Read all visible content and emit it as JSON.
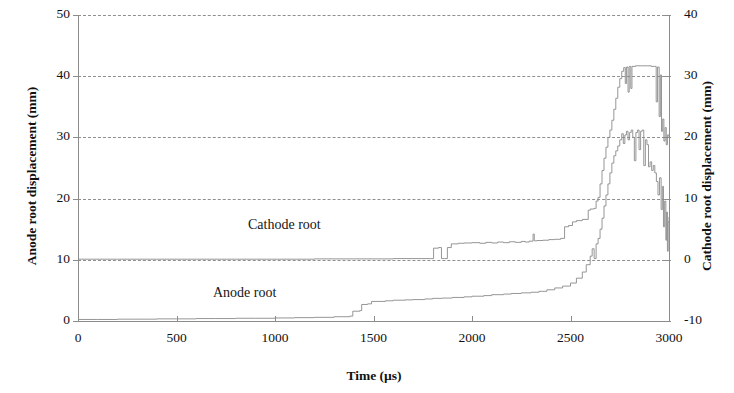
{
  "chart_data": {
    "type": "line",
    "title": "",
    "xlabel": "Time (µs)",
    "ylabel": "Anode root displacement (mm)",
    "y2label": "Cathode root displacement (mm)",
    "xlim": [
      0,
      3000
    ],
    "ylim": [
      0,
      50
    ],
    "y2lim": [
      -10,
      40
    ],
    "xticks": [
      0,
      500,
      1000,
      1500,
      2000,
      2500,
      3000
    ],
    "yticks": [
      0,
      10,
      20,
      30,
      40,
      50
    ],
    "y2ticks": [
      -10,
      0,
      10,
      20,
      30,
      40
    ],
    "xtick_labels": [
      "0",
      "500",
      "1000",
      "1500",
      "2000",
      "2500",
      "3000"
    ],
    "ytick_labels": [
      "0",
      "10",
      "20",
      "30",
      "40",
      "50"
    ],
    "y2tick_labels": [
      "-10",
      "0",
      "10",
      "20",
      "30",
      "40"
    ],
    "grid": true,
    "grid_style": "dashed-horizontal",
    "legend": "none",
    "line_color": "#8a8a8a",
    "axis_color": "#8c8c8c",
    "text_color": "#111111",
    "annotations": [
      {
        "text": "Cathode root",
        "x": 1050,
        "y_left": 16.5
      },
      {
        "text": "Anode root",
        "x": 870,
        "y_left": 5.5
      }
    ],
    "series": [
      {
        "name": "Anode root",
        "axis": "left",
        "units": "mm",
        "points": [
          [
            0,
            0.25
          ],
          [
            100,
            0.25
          ],
          [
            200,
            0.3
          ],
          [
            300,
            0.3
          ],
          [
            400,
            0.35
          ],
          [
            500,
            0.35
          ],
          [
            600,
            0.4
          ],
          [
            700,
            0.4
          ],
          [
            800,
            0.45
          ],
          [
            900,
            0.45
          ],
          [
            1000,
            0.5
          ],
          [
            1100,
            0.55
          ],
          [
            1200,
            0.6
          ],
          [
            1300,
            0.7
          ],
          [
            1380,
            0.8
          ],
          [
            1395,
            1.6
          ],
          [
            1430,
            1.7
          ],
          [
            1440,
            2.7
          ],
          [
            1470,
            2.8
          ],
          [
            1490,
            3.2
          ],
          [
            1560,
            3.3
          ],
          [
            1600,
            3.4
          ],
          [
            1660,
            3.45
          ],
          [
            1700,
            3.5
          ],
          [
            1760,
            3.6
          ],
          [
            1800,
            3.7
          ],
          [
            1850,
            3.75
          ],
          [
            1900,
            3.85
          ],
          [
            1960,
            3.95
          ],
          [
            2000,
            4.05
          ],
          [
            2060,
            4.15
          ],
          [
            2100,
            4.3
          ],
          [
            2160,
            4.4
          ],
          [
            2200,
            4.5
          ],
          [
            2250,
            4.6
          ],
          [
            2300,
            4.7
          ],
          [
            2340,
            4.85
          ],
          [
            2380,
            5.1
          ],
          [
            2420,
            5.4
          ],
          [
            2460,
            5.7
          ],
          [
            2500,
            6.2
          ],
          [
            2530,
            7.0
          ],
          [
            2560,
            8.0
          ],
          [
            2580,
            9.2
          ],
          [
            2600,
            10.6
          ],
          [
            2610,
            11.8
          ],
          [
            2620,
            10.2
          ],
          [
            2630,
            12.6
          ],
          [
            2640,
            13.5
          ],
          [
            2650,
            15.0
          ],
          [
            2660,
            16.8
          ],
          [
            2670,
            18.8
          ],
          [
            2680,
            20.6
          ],
          [
            2690,
            22.4
          ],
          [
            2700,
            24.2
          ],
          [
            2710,
            25.8
          ],
          [
            2720,
            27.0
          ],
          [
            2730,
            27.8
          ],
          [
            2740,
            28.6
          ],
          [
            2750,
            29.6
          ],
          [
            2760,
            30.6
          ],
          [
            2768,
            29.0
          ],
          [
            2776,
            30.4
          ],
          [
            2784,
            31.0
          ],
          [
            2792,
            29.6
          ],
          [
            2800,
            30.8
          ],
          [
            2808,
            31.2
          ],
          [
            2816,
            30.0
          ],
          [
            2824,
            26.2
          ],
          [
            2832,
            30.8
          ],
          [
            2840,
            31.2
          ],
          [
            2848,
            28.0
          ],
          [
            2856,
            31.0
          ],
          [
            2864,
            31.2
          ],
          [
            2872,
            25.4
          ],
          [
            2880,
            29.6
          ],
          [
            2888,
            28.8
          ],
          [
            2896,
            25.2
          ],
          [
            2904,
            26.0
          ],
          [
            2912,
            24.6
          ],
          [
            2920,
            25.4
          ],
          [
            2928,
            24.2
          ],
          [
            2936,
            22.8
          ],
          [
            2944,
            20.6
          ],
          [
            2952,
            23.4
          ],
          [
            2960,
            18.2
          ],
          [
            2966,
            22.0
          ],
          [
            2972,
            15.4
          ],
          [
            2978,
            19.6
          ],
          [
            2984,
            13.2
          ],
          [
            2988,
            17.8
          ],
          [
            2992,
            11.4
          ],
          [
            2996,
            16.2
          ],
          [
            3000,
            17.0
          ]
        ]
      },
      {
        "name": "Cathode root",
        "axis": "right",
        "units": "mm",
        "points_left_axis": [
          [
            0,
            10.1
          ],
          [
            200,
            10.1
          ],
          [
            400,
            10.1
          ],
          [
            600,
            10.1
          ],
          [
            800,
            10.1
          ],
          [
            1000,
            10.1
          ],
          [
            1200,
            10.15
          ],
          [
            1400,
            10.15
          ],
          [
            1600,
            10.2
          ],
          [
            1700,
            10.2
          ],
          [
            1790,
            10.2
          ],
          [
            1805,
            11.9
          ],
          [
            1830,
            12.0
          ],
          [
            1845,
            10.2
          ],
          [
            1860,
            10.2
          ],
          [
            1875,
            12.0
          ],
          [
            1895,
            12.6
          ],
          [
            1930,
            12.7
          ],
          [
            1960,
            12.75
          ],
          [
            2000,
            12.8
          ],
          [
            2040,
            12.7
          ],
          [
            2070,
            12.85
          ],
          [
            2100,
            12.75
          ],
          [
            2130,
            12.9
          ],
          [
            2160,
            12.8
          ],
          [
            2190,
            12.95
          ],
          [
            2220,
            12.85
          ],
          [
            2250,
            13.0
          ],
          [
            2270,
            12.9
          ],
          [
            2290,
            13.05
          ],
          [
            2310,
            14.2
          ],
          [
            2316,
            13.1
          ],
          [
            2330,
            13.15
          ],
          [
            2360,
            13.2
          ],
          [
            2390,
            13.3
          ],
          [
            2420,
            13.35
          ],
          [
            2450,
            13.5
          ],
          [
            2470,
            15.4
          ],
          [
            2490,
            15.6
          ],
          [
            2510,
            16.2
          ],
          [
            2530,
            16.4
          ],
          [
            2560,
            16.6
          ],
          [
            2590,
            18.1
          ],
          [
            2600,
            18.3
          ],
          [
            2620,
            18.4
          ],
          [
            2630,
            19.6
          ],
          [
            2640,
            20.2
          ],
          [
            2650,
            22.4
          ],
          [
            2660,
            24.6
          ],
          [
            2670,
            26.6
          ],
          [
            2680,
            28.4
          ],
          [
            2690,
            30.0
          ],
          [
            2700,
            31.2
          ],
          [
            2710,
            32.8
          ],
          [
            2720,
            34.6
          ],
          [
            2730,
            36.4
          ],
          [
            2740,
            38.2
          ],
          [
            2750,
            39.6
          ],
          [
            2760,
            40.8
          ],
          [
            2770,
            41.4
          ],
          [
            2778,
            38.8
          ],
          [
            2784,
            41.5
          ],
          [
            2792,
            37.4
          ],
          [
            2798,
            41.6
          ],
          [
            2806,
            38.0
          ],
          [
            2812,
            41.6
          ],
          [
            2830,
            41.7
          ],
          [
            2860,
            41.7
          ],
          [
            2890,
            41.7
          ],
          [
            2910,
            41.6
          ],
          [
            2925,
            41.6
          ],
          [
            2935,
            35.8
          ],
          [
            2942,
            41.5
          ],
          [
            2950,
            33.4
          ],
          [
            2956,
            40.2
          ],
          [
            2962,
            31.0
          ],
          [
            2968,
            33.0
          ],
          [
            2974,
            29.4
          ],
          [
            2980,
            31.6
          ],
          [
            2986,
            28.8
          ],
          [
            2992,
            30.4
          ],
          [
            3000,
            30.0
          ]
        ]
      }
    ]
  },
  "axes": {
    "left_title": "Anode root displacement (mm)",
    "right_title": "Cathode root displacement (mm)",
    "x_title": "Time (µs)"
  }
}
